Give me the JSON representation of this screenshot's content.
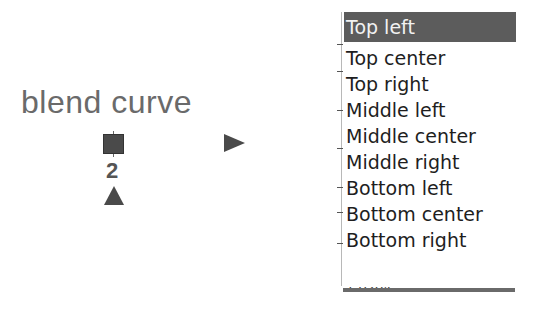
{
  "node": {
    "label": "blend curve",
    "input_port_icon": "square-port-icon",
    "output_port_icon": "triangle-right-icon",
    "index_label": "2",
    "index_port_icon": "triangle-up-icon"
  },
  "dropdown": {
    "selected_index": 0,
    "items": [
      {
        "label": "Top left"
      },
      {
        "label": "Top center"
      },
      {
        "label": "Top right"
      },
      {
        "label": "Middle left"
      },
      {
        "label": "Middle center"
      },
      {
        "label": "Middle right"
      },
      {
        "label": "Bottom left"
      },
      {
        "label": "Bottom center"
      },
      {
        "label": "Bottom right"
      }
    ],
    "partial_value_below": "1.0204"
  },
  "colors": {
    "selection_bg": "#5c5c5c",
    "selection_text": "#f2f2f2",
    "item_text": "#1e1e1e",
    "icon_fill": "#4a4a4a",
    "label_text": "#6a6a6a"
  }
}
